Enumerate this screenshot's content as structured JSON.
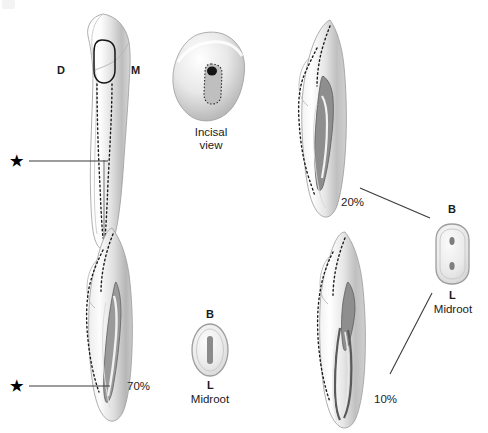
{
  "figure": {
    "domain": "anatomical-illustration",
    "background_color": "#ffffff",
    "ink_color": "#1a1a1a"
  },
  "labels": {
    "distal": "D",
    "mesial": "M",
    "buccal": "B",
    "lingual": "L",
    "incisal_view_line1": "Incisal",
    "incisal_view_line2": "view",
    "midroot": "Midroot",
    "asterisk": "★"
  },
  "percentages": {
    "top_right": "20%",
    "bottom_left": "70%",
    "bottom_right": "10%"
  },
  "panels": [
    {
      "id": "proximal-view",
      "position": "top-left",
      "labels": [
        "D",
        "M"
      ],
      "marker": "★",
      "canals": 1,
      "description": "Proximal (facial) view of mandibular incisor with pulp chamber outline and dotted canal tracings"
    },
    {
      "id": "incisal-view",
      "position": "top-center",
      "caption": [
        "Incisal",
        "view"
      ],
      "description": "Incisal aspect showing slot-shaped canal orifice"
    },
    {
      "id": "single-canal-20",
      "position": "top-right",
      "percent": "20%",
      "canals": 2,
      "description": "Longitudinal section showing two canals, 20% incidence"
    },
    {
      "id": "single-canal-70",
      "position": "bottom-left",
      "percent": "70%",
      "marker": "★",
      "canals": 1,
      "description": "Longitudinal section showing one canal, 70% incidence"
    },
    {
      "id": "two-canal-10",
      "position": "bottom-right",
      "percent": "10%",
      "canals": 2,
      "description": "Longitudinal section showing two separate canals, 10% incidence"
    }
  ],
  "cross_sections": [
    {
      "id": "midroot-single",
      "position": "bottom-center",
      "top_label": "B",
      "bottom_label": "L",
      "caption": "Midroot",
      "canal_count": 1,
      "canal_shape": "elongated-oval"
    },
    {
      "id": "midroot-double",
      "position": "right",
      "top_label": "B",
      "bottom_label": "L",
      "caption": "Midroot",
      "canal_count": 2,
      "canal_shape": "two-round-canals"
    }
  ]
}
